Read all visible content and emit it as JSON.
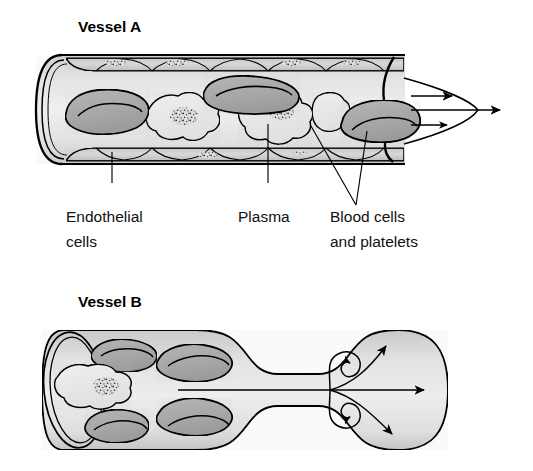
{
  "figure": {
    "kind": "biology-diagram",
    "background_color": "#ffffff"
  },
  "vessel_a": {
    "title": "Vessel A",
    "flow_type": "laminar",
    "arrow_count": 3,
    "arrow_labels": [
      "",
      "",
      ""
    ],
    "contents": {
      "red_blood_cells": 3,
      "white_blood_cells": 3
    }
  },
  "vessel_b": {
    "title": "Vessel B",
    "flow_type": "turbulent",
    "arrow_count": 3,
    "eddy_count": 2,
    "contents": {
      "red_blood_cells": 4,
      "white_blood_cells": 1
    }
  },
  "callouts": [
    {
      "name": "endothelial-cells",
      "line1": "Endothelial",
      "line2": "cells"
    },
    {
      "name": "plasma",
      "line1": "Plasma",
      "line2": ""
    },
    {
      "name": "blood-cells-platelets",
      "line1": "Blood cells",
      "line2": "and platelets"
    }
  ],
  "colors": {
    "outline": "#000000",
    "lumen_fill": "#e3e3e3",
    "wall_fill": "#d2d2d2",
    "red_blood_cell_fill": "#a9a9a9",
    "white_blood_cell_fill": "#e8e8e8",
    "nucleus_stipple": "#2b2b2b",
    "text": "#111111",
    "background": "#ffffff"
  }
}
